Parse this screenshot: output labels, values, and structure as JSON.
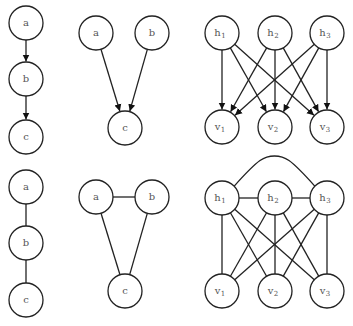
{
  "style": {
    "stroke": "#222222",
    "node_fill": "#ffffff",
    "label_color": "#555555",
    "node_radius": 17
  },
  "graphs": [
    {
      "id": "chain-directed",
      "directed": true,
      "nodes": [
        {
          "id": "a",
          "label": "a",
          "x": 26,
          "y": 23
        },
        {
          "id": "b",
          "label": "b",
          "x": 26,
          "y": 79
        },
        {
          "id": "c",
          "label": "c",
          "x": 26,
          "y": 137
        }
      ],
      "edges": [
        [
          "a",
          "b"
        ],
        [
          "b",
          "c"
        ]
      ]
    },
    {
      "id": "v-structure-directed",
      "directed": true,
      "nodes": [
        {
          "id": "a",
          "label": "a",
          "x": 96,
          "y": 33
        },
        {
          "id": "b",
          "label": "b",
          "x": 152,
          "y": 33
        },
        {
          "id": "c",
          "label": "c",
          "x": 125,
          "y": 128
        }
      ],
      "edges": [
        [
          "a",
          "c"
        ],
        [
          "b",
          "c"
        ]
      ]
    },
    {
      "id": "bipartite-directed",
      "directed": true,
      "nodes": [
        {
          "id": "h1",
          "label": "h",
          "sub": "1",
          "x": 222,
          "y": 33
        },
        {
          "id": "h2",
          "label": "h",
          "sub": "2",
          "x": 275,
          "y": 33
        },
        {
          "id": "h3",
          "label": "h",
          "sub": "3",
          "x": 327,
          "y": 33
        },
        {
          "id": "v1",
          "label": "v",
          "sub": "1",
          "x": 222,
          "y": 127
        },
        {
          "id": "v2",
          "label": "v",
          "sub": "2",
          "x": 275,
          "y": 127
        },
        {
          "id": "v3",
          "label": "v",
          "sub": "3",
          "x": 327,
          "y": 127
        }
      ],
      "edges": [
        [
          "h1",
          "v1"
        ],
        [
          "h1",
          "v2"
        ],
        [
          "h1",
          "v3"
        ],
        [
          "h2",
          "v1"
        ],
        [
          "h2",
          "v2"
        ],
        [
          "h2",
          "v3"
        ],
        [
          "h3",
          "v1"
        ],
        [
          "h3",
          "v2"
        ],
        [
          "h3",
          "v3"
        ]
      ]
    },
    {
      "id": "chain-undirected",
      "directed": false,
      "nodes": [
        {
          "id": "a",
          "label": "a",
          "x": 26,
          "y": 187
        },
        {
          "id": "b",
          "label": "b",
          "x": 26,
          "y": 243
        },
        {
          "id": "c",
          "label": "c",
          "x": 26,
          "y": 300
        }
      ],
      "edges": [
        [
          "a",
          "b"
        ],
        [
          "b",
          "c"
        ]
      ]
    },
    {
      "id": "triangle-undirected",
      "directed": false,
      "nodes": [
        {
          "id": "a",
          "label": "a",
          "x": 96,
          "y": 197
        },
        {
          "id": "b",
          "label": "b",
          "x": 152,
          "y": 197
        },
        {
          "id": "c",
          "label": "c",
          "x": 125,
          "y": 291
        }
      ],
      "edges": [
        [
          "a",
          "b"
        ],
        [
          "a",
          "c"
        ],
        [
          "b",
          "c"
        ]
      ]
    },
    {
      "id": "moralized-undirected",
      "directed": false,
      "nodes": [
        {
          "id": "h1",
          "label": "h",
          "sub": "1",
          "x": 222,
          "y": 198
        },
        {
          "id": "h2",
          "label": "h",
          "sub": "2",
          "x": 275,
          "y": 198
        },
        {
          "id": "h3",
          "label": "h",
          "sub": "3",
          "x": 327,
          "y": 198
        },
        {
          "id": "v1",
          "label": "v",
          "sub": "1",
          "x": 222,
          "y": 291
        },
        {
          "id": "v2",
          "label": "v",
          "sub": "2",
          "x": 275,
          "y": 291
        },
        {
          "id": "v3",
          "label": "v",
          "sub": "3",
          "x": 327,
          "y": 291
        }
      ],
      "edges": [
        [
          "h1",
          "h2"
        ],
        [
          "h2",
          "h3"
        ],
        [
          "h1",
          "v1"
        ],
        [
          "h1",
          "v2"
        ],
        [
          "h1",
          "v3"
        ],
        [
          "h2",
          "v1"
        ],
        [
          "h2",
          "v2"
        ],
        [
          "h2",
          "v3"
        ],
        [
          "h3",
          "v1"
        ],
        [
          "h3",
          "v2"
        ],
        [
          "h3",
          "v3"
        ]
      ],
      "curved_edges": [
        [
          "h1",
          "h3"
        ]
      ]
    }
  ]
}
